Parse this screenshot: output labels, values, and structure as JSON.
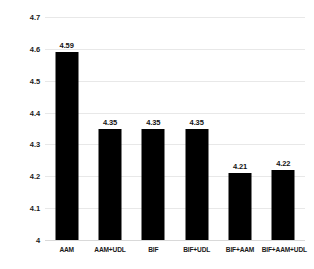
{
  "chart_data": {
    "type": "bar",
    "title": "",
    "subtitle": "",
    "xlabel": "",
    "ylabel": "",
    "categories": [
      "AAM",
      "AAM+UDL",
      "BIF",
      "BIF+UDL",
      "BIF+AAM",
      "BIF+AAM+UDL"
    ],
    "values": [
      4.59,
      4.35,
      4.35,
      4.35,
      4.21,
      4.22
    ],
    "data_labels": [
      "4.59",
      "4.35",
      "4.35",
      "4.35",
      "4.21",
      "4.22"
    ],
    "ylim": [
      4,
      4.7
    ],
    "ytick_values": [
      4.7,
      4.6,
      4.5,
      4.4,
      4.3,
      4.2,
      4.1,
      4
    ],
    "ytick_labels": [
      "4.7",
      "4.6",
      "4.5",
      "4.4",
      "4.3",
      "4.2",
      "4.1",
      "4"
    ],
    "ytick_step": 0.1,
    "grid": true,
    "grid_axis": "y",
    "legend": false,
    "legend_position": "none",
    "bar_color": "#000000",
    "grid_color": "#e8e8e8",
    "background_color": "#ffffff",
    "label_color": "#1a1a1a"
  }
}
